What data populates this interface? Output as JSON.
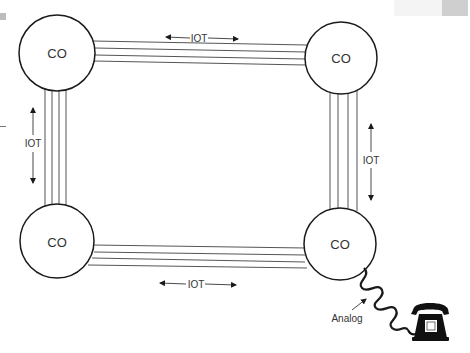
{
  "diagram": {
    "type": "network-topology",
    "nodes": [
      {
        "id": "co-top-left",
        "label": "CO",
        "cx": 57,
        "cy": 53,
        "r": 38
      },
      {
        "id": "co-top-right",
        "label": "CO",
        "cx": 341,
        "cy": 58,
        "r": 36
      },
      {
        "id": "co-bottom-left",
        "label": "CO",
        "cx": 57,
        "cy": 241,
        "r": 37
      },
      {
        "id": "co-bottom-right",
        "label": "CO",
        "cx": 340,
        "cy": 244,
        "r": 36
      }
    ],
    "links": [
      {
        "id": "link-top",
        "from": "co-top-left",
        "to": "co-top-right",
        "label": "IOT",
        "lines": 4
      },
      {
        "id": "link-left",
        "from": "co-top-left",
        "to": "co-bottom-left",
        "label": "IOT",
        "lines": 4
      },
      {
        "id": "link-right",
        "from": "co-top-right",
        "to": "co-bottom-right",
        "label": "IOT",
        "lines": 4
      },
      {
        "id": "link-bottom",
        "from": "co-bottom-left",
        "to": "co-bottom-right",
        "label": "IOT",
        "lines": 4
      }
    ],
    "endpoint": {
      "id": "telephone",
      "label": "Analog",
      "connected_to": "co-bottom-right",
      "icon": "telephone-icon"
    }
  },
  "labels": {
    "co_top_left": "CO",
    "co_top_right": "CO",
    "co_bottom_left": "CO",
    "co_bottom_right": "CO",
    "iot_top": "IOT",
    "iot_left": "IOT",
    "iot_right": "IOT",
    "iot_bottom": "IOT",
    "analog": "Analog"
  },
  "colors": {
    "stroke": "#1a1a1a",
    "trunk_line": "#555555",
    "text": "#333333",
    "background": "#ffffff"
  }
}
